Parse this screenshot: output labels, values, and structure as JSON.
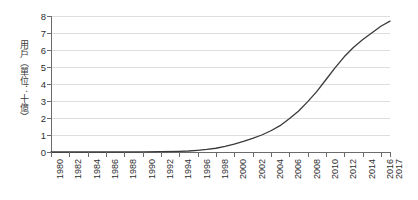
{
  "chart_data": {
    "type": "line",
    "title": "",
    "xlabel": "",
    "ylabel": "用戶（單位：十億）",
    "xlim": [
      1980,
      2017
    ],
    "ylim": [
      0,
      8
    ],
    "grid": true,
    "legend": "none",
    "line_color": "#3a3a3a",
    "grid_color": "#dedede",
    "axis_color": "#6b6b6b",
    "y_ticks": [
      0,
      1,
      2,
      3,
      4,
      5,
      6,
      7,
      8
    ],
    "x_ticks": [
      1980,
      1982,
      1984,
      1986,
      1988,
      1990,
      1992,
      1994,
      1996,
      1998,
      2000,
      2002,
      2004,
      2006,
      2008,
      2010,
      2012,
      2014,
      2016,
      2017
    ],
    "x": [
      1980,
      1982,
      1984,
      1986,
      1988,
      1990,
      1992,
      1994,
      1995,
      1996,
      1997,
      1998,
      1999,
      2000,
      2001,
      2002,
      2003,
      2004,
      2005,
      2006,
      2007,
      2008,
      2009,
      2010,
      2011,
      2012,
      2013,
      2014,
      2015,
      2016,
      2017
    ],
    "values": [
      0.0,
      0.0,
      0.0,
      0.0,
      0.0,
      0.01,
      0.02,
      0.04,
      0.06,
      0.1,
      0.15,
      0.22,
      0.33,
      0.47,
      0.62,
      0.8,
      1.0,
      1.25,
      1.55,
      1.95,
      2.4,
      2.95,
      3.55,
      4.25,
      4.95,
      5.6,
      6.15,
      6.6,
      7.0,
      7.4,
      7.7
    ]
  }
}
